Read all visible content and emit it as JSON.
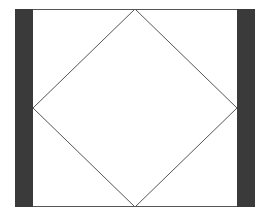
{
  "diagram": {
    "colors": {
      "background": "#ffffff",
      "bar": "#3a3a3a",
      "line": "#555555"
    },
    "frame": {
      "x": 15,
      "y": 9,
      "width": 240,
      "height": 198
    },
    "left_bar": {
      "x": 15,
      "y": 9,
      "width": 18,
      "height": 198
    },
    "right_bar": {
      "x": 237,
      "y": 9,
      "width": 18,
      "height": 198
    },
    "diamond": {
      "points": [
        [
          135,
          9
        ],
        [
          237,
          108
        ],
        [
          135,
          207
        ],
        [
          33,
          108
        ]
      ]
    }
  }
}
